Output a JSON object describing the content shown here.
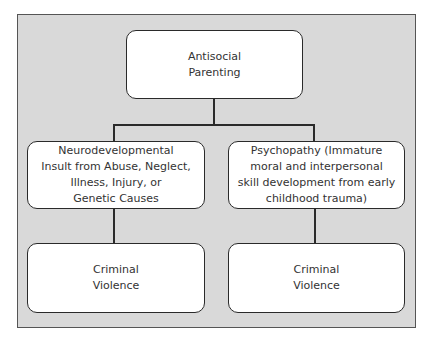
{
  "diagram": {
    "type": "flowchart",
    "nodes": [
      {
        "id": "antisocial_parenting",
        "label": "Antisocial\nParenting",
        "level": 0
      },
      {
        "id": "neurodevelopmental_insult",
        "label": "Neurodevelopmental\nInsult from Abuse, Neglect,\nIllness, Injury, or\nGenetic Causes",
        "level": 1
      },
      {
        "id": "psychopathy",
        "label": "Psychopathy (Immature\nmoral and interpersonal\nskill development from early\nchildhood trauma)",
        "level": 1
      },
      {
        "id": "criminal_violence_left",
        "label": "Criminal\nViolence",
        "level": 2
      },
      {
        "id": "criminal_violence_right",
        "label": "Criminal\nViolence",
        "level": 2
      }
    ],
    "edges": [
      {
        "from": "antisocial_parenting",
        "to": "neurodevelopmental_insult"
      },
      {
        "from": "antisocial_parenting",
        "to": "psychopathy"
      },
      {
        "from": "neurodevelopmental_insult",
        "to": "criminal_violence_left"
      },
      {
        "from": "psychopathy",
        "to": "criminal_violence_right"
      }
    ]
  },
  "colors": {
    "frame_background": "#d9d9d9",
    "node_background": "#ffffff",
    "line": "#2a2a2a",
    "text": "#333333"
  }
}
